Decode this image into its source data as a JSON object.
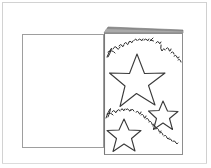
{
  "figure": {
    "title": "Open greeting card with hand-drawn stars",
    "medium": "pen line drawing / scan",
    "background_color": "#ffffff",
    "ink_color": "#2b2b2b",
    "frame_color": "#cfcfcf",
    "fold_shade_color": "#8c8c8c",
    "panel_outline_color": "#9a9a9a"
  },
  "frame": {
    "label": "scan border",
    "x": 2,
    "y": 2,
    "width": 205,
    "height": 162
  },
  "card": {
    "label": "greeting card",
    "orientation": "open, viewed at an angle",
    "left_panel": {
      "label": "left inside panel (blank)",
      "x": 22,
      "y": 34,
      "width": 82,
      "height": 114,
      "fill": "#ffffff"
    },
    "right_panel": {
      "label": "right front panel (decorated)",
      "x": 104,
      "y": 33,
      "width": 79,
      "height": 122,
      "fill": "#ffffff"
    },
    "fold": {
      "label": "card fold wedge at top",
      "description": "thin shaded triangular wedge running from the fold line up to the top-right corner"
    },
    "spine_x": 104
  },
  "handwriting": {
    "line_1": {
      "text": "Hope you're warm at Christmas",
      "style": "cursive script, arcing over the large star",
      "position": "upper area of right panel, curving up then down to the right edge"
    },
    "line_2": {
      "text": "share and sparkle the",
      "style": "cursive script, descending diagonally",
      "position": "lower area of right panel, running down-right between the small stars"
    }
  },
  "stars": [
    {
      "name": "large-star",
      "label": "large five-point star",
      "center_x": 137,
      "center_y": 81,
      "radius": 28,
      "rotation_deg": -12,
      "filled": false
    },
    {
      "name": "small-star-right",
      "label": "small five-point star, right",
      "center_x": 163,
      "center_y": 116,
      "radius": 15,
      "rotation_deg": 8,
      "filled": false
    },
    {
      "name": "small-star-bottom",
      "label": "small five-point star, bottom left",
      "center_x": 124,
      "center_y": 136,
      "radius": 17,
      "rotation_deg": -5,
      "filled": false
    }
  ]
}
